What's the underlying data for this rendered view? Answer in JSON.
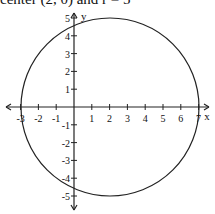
{
  "caption": "center (2, 0) and r = 5",
  "graph": {
    "x_axis_label": "x",
    "y_axis_label": "y",
    "x_ticks": [
      "-3",
      "-2",
      "-1",
      "1",
      "2",
      "3",
      "4",
      "5",
      "6",
      "7"
    ],
    "y_ticks": [
      "5",
      "4",
      "3",
      "2",
      "1",
      "-1",
      "-2",
      "-3",
      "-4",
      "-5"
    ],
    "circle": {
      "center": [
        2,
        0
      ],
      "radius": 5
    }
  }
}
